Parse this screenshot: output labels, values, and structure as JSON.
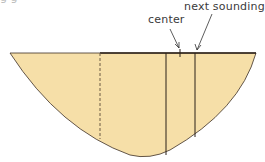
{
  "diagram": {
    "type": "channel cross-section",
    "labels": {
      "center": "center",
      "next_sounding": "next sounding",
      "cut_off_text": "g      g"
    },
    "colors": {
      "fill": "#f6dfa8",
      "stroke": "#3c2f25",
      "text": "#3a3a3a"
    },
    "lines": [
      {
        "name": "previous-sounding",
        "style": "dashed",
        "x": 100
      },
      {
        "name": "sounding-line",
        "style": "solid",
        "x": 166
      },
      {
        "name": "next-sounding",
        "style": "solid",
        "x": 195
      }
    ]
  }
}
